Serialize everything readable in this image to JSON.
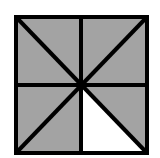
{
  "figure": {
    "total_parts": 8,
    "shaded_parts": 7,
    "unshaded_parts": 1,
    "unshaded_position": "bottom-right lower triangle",
    "colors": {
      "shade": "#a3a3a3",
      "unshaded": "#ffffff",
      "line": "#000000"
    }
  }
}
